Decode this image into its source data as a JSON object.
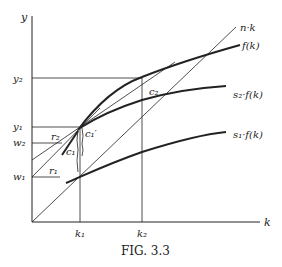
{
  "figure": {
    "caption": "FIG. 3.3",
    "axes": {
      "y_label": "y",
      "x_label": "k"
    },
    "curves": {
      "nk": "n·k",
      "f": "f(k)",
      "s2f": "s₂·f(k)",
      "s1f": "s₁·f(k)"
    },
    "y_ticks": {
      "y2": "y₂",
      "y1": "y₁",
      "w2": "w₂",
      "w1": "w₁"
    },
    "x_ticks": {
      "k1": "k₁",
      "k2": "k₂"
    },
    "annotations": {
      "r2": "r₂",
      "r1": "r₁",
      "c1": "c₁",
      "c1p": "c₁′",
      "c2": "c₂"
    },
    "colors": {
      "ink": "#222222",
      "background": "#ffffff"
    }
  }
}
